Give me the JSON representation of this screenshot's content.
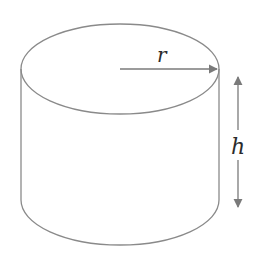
{
  "diagram": {
    "shape": "cylinder",
    "labels": {
      "radius": "r",
      "height": "h"
    },
    "colors": {
      "outline": "#8a8a8a",
      "arrow": "#7a7a7a",
      "text": "#2b2b2b",
      "background": "#ffffff"
    }
  }
}
